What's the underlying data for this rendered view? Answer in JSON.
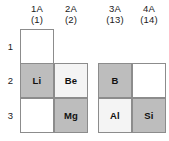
{
  "figure": {
    "colors": {
      "cell_gray": "#bdbdbd",
      "cell_light": "#f4f4f4",
      "cell_white": "#ffffff",
      "border": "#8c8c8c",
      "text": "#111111",
      "background": "#ffffff"
    },
    "columns": [
      {
        "group": "1A",
        "number": "(1)",
        "x": 20
      },
      {
        "group": "2A",
        "number": "(2)",
        "x": 54
      },
      {
        "group": "3A",
        "number": "(13)",
        "x": 98
      },
      {
        "group": "4A",
        "number": "(14)",
        "x": 132
      }
    ],
    "rows": [
      {
        "label": "1",
        "y": 29
      },
      {
        "label": "2",
        "y": 63
      },
      {
        "label": "3",
        "y": 98
      }
    ],
    "cells": [
      {
        "symbol": "",
        "group": "1A",
        "period": "1",
        "fill": "fill-white",
        "x": 20,
        "y": 29
      },
      {
        "symbol": "Li",
        "group": "1A",
        "period": "2",
        "fill": "fill-gray",
        "x": 20,
        "y": 63
      },
      {
        "symbol": "Be",
        "group": "2A",
        "period": "2",
        "fill": "fill-light",
        "x": 54,
        "y": 63
      },
      {
        "symbol": "",
        "group": "1A",
        "period": "3",
        "fill": "fill-white",
        "x": 20,
        "y": 98
      },
      {
        "symbol": "Mg",
        "group": "2A",
        "period": "3",
        "fill": "fill-gray",
        "x": 54,
        "y": 98
      },
      {
        "symbol": "B",
        "group": "3A",
        "period": "2",
        "fill": "fill-gray",
        "x": 98,
        "y": 63
      },
      {
        "symbol": "",
        "group": "4A",
        "period": "2",
        "fill": "fill-white",
        "x": 132,
        "y": 63
      },
      {
        "symbol": "Al",
        "group": "3A",
        "period": "3",
        "fill": "fill-light",
        "x": 98,
        "y": 98
      },
      {
        "symbol": "Si",
        "group": "4A",
        "period": "3",
        "fill": "fill-gray",
        "x": 132,
        "y": 98
      }
    ]
  }
}
